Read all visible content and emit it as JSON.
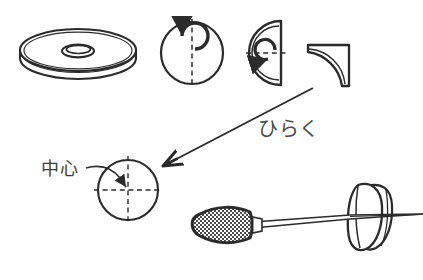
{
  "page": {
    "background_color": "#ffffff",
    "ink_color": "#2b2b2b",
    "width": 423,
    "height": 280
  },
  "top_cut_text": {
    "text": "□□□ □□□□ □□",
    "note": "partially cropped line of text at very top edge"
  },
  "labels": {
    "hiraku": "ひらく",
    "chushin": "中心"
  },
  "steps": [
    {
      "id": "step-1-disc",
      "name": "disc-3d",
      "caption": "",
      "description": "round flat disc with center hole, drawn in perspective"
    },
    {
      "id": "step-2-circle-fold",
      "name": "circle-fold-vertical",
      "caption": "",
      "description": "flat circle with vertical dashed fold line and curved fold arrow"
    },
    {
      "id": "step-3-halfdisc-fold",
      "name": "half-disc-fold-horizontal",
      "caption": "",
      "description": "half circle folded, horizontal dashed fold line and curved fold arrow"
    },
    {
      "id": "step-4-quarter",
      "name": "quarter-wedge",
      "caption": "",
      "description": "quarter circle wedge, result of two folds"
    },
    {
      "id": "step-5-target",
      "name": "circle-with-crosshair",
      "caption": "中心",
      "description": "opened circle showing dashed crosshair locating the center point"
    },
    {
      "id": "step-6-awl",
      "name": "awl-piercing-disc",
      "caption": "",
      "description": "awl with textured handle piercing the disc at its center"
    }
  ],
  "arrows": [
    {
      "id": "arrow-unfold",
      "name": "unfold-arrow",
      "label": "ひらく",
      "from": "quarter-wedge",
      "to": "circle-with-crosshair"
    },
    {
      "id": "arrow-center-leader",
      "name": "center-leader-arrow",
      "label": "中心",
      "from": "chushin-label",
      "to": "circle-center-point"
    }
  ]
}
